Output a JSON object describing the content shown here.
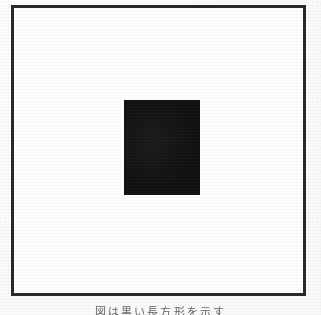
{
  "page": {
    "kind": "scanned-figure-page",
    "background_color": "#fdfdfd",
    "width_px": 321,
    "height_px": 315
  },
  "figure": {
    "frame": {
      "label": "figure border",
      "stroke_color": "#2a2a2c",
      "stroke_width_px": 3,
      "fill_color": "#ffffff",
      "left_px": 11,
      "top_px": 5,
      "width_px": 295,
      "height_px": 291
    },
    "shape": {
      "label": "solid black rectangle",
      "fill_color": "#111113",
      "left_px": 124,
      "top_px": 100,
      "width_px": 76,
      "height_px": 95
    }
  },
  "caption": {
    "text": "図は黒い長方形を示す",
    "note": "caption line is clipped by the bottom edge of the crop",
    "color": "#4a4a4c"
  }
}
